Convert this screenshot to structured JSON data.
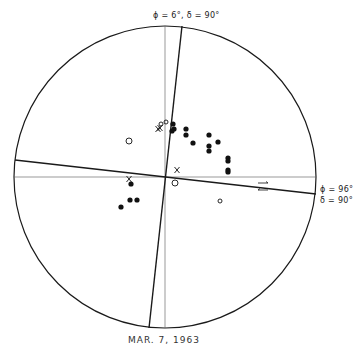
{
  "labels": {
    "top_axis": "ϕ = 6°,  δ = 90°",
    "right_axis_phi": "ϕ = 96°",
    "right_axis_delta": "δ = 90°",
    "caption": "MAR.  7,  1963"
  },
  "colors": {
    "line": "#1a1a1a",
    "thin_line": "#555555",
    "dot": "#111111"
  },
  "diagram": {
    "circle": {
      "cx": 165,
      "cy": 177,
      "r": 151
    },
    "reference_axes": [
      {
        "name": "vertical",
        "x1": 165,
        "y1": 26,
        "x2": 165,
        "y2": 328
      },
      {
        "name": "horizontal",
        "x1": 14,
        "y1": 177,
        "x2": 316,
        "y2": 177
      }
    ],
    "nodal_planes": [
      {
        "name": "phi-6",
        "x1": 182,
        "y1": 26,
        "x2": 149,
        "y2": 328
      },
      {
        "name": "phi-96",
        "x1": 15,
        "y1": 160,
        "x2": 316,
        "y2": 194
      }
    ],
    "filled_dots": [
      [
        173,
        124
      ],
      [
        174,
        129
      ],
      [
        172,
        131
      ],
      [
        186,
        129
      ],
      [
        186,
        135
      ],
      [
        193,
        143
      ],
      [
        209,
        135
      ],
      [
        218,
        142
      ],
      [
        209,
        146
      ],
      [
        209,
        151
      ],
      [
        228,
        158
      ],
      [
        228,
        161
      ],
      [
        228,
        170
      ],
      [
        228,
        172
      ],
      [
        131,
        184
      ],
      [
        130,
        200
      ],
      [
        137,
        200
      ],
      [
        121,
        207
      ]
    ],
    "open_circles": [
      {
        "x": 129,
        "y": 141,
        "r": 3
      },
      {
        "x": 175,
        "y": 183,
        "r": 3
      },
      {
        "x": 220,
        "y": 201,
        "r": 2
      },
      {
        "x": 161,
        "y": 124,
        "r": 2
      },
      {
        "x": 166,
        "y": 122,
        "r": 2
      }
    ],
    "crosses": [
      [
        158,
        129
      ],
      [
        160,
        128
      ],
      [
        177,
        170
      ],
      [
        129,
        179
      ]
    ],
    "arrows": [
      {
        "x": 263,
        "y": 183
      },
      {
        "x": 263,
        "y": 190
      }
    ]
  }
}
